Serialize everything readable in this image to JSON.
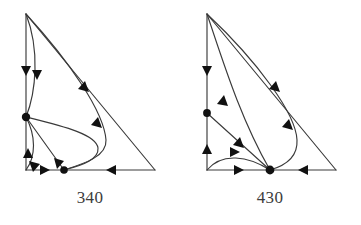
{
  "figure": {
    "type": "directed-graph-pair",
    "background_color": "#ffffff",
    "stroke_color": "#3a3a3a",
    "marker_color": "#111111",
    "caption_color": "#3c3c3c",
    "panels": [
      {
        "id": "panel-340",
        "caption": "340",
        "node_count": 4,
        "nodes": [
          {
            "name": "apex",
            "x": 26,
            "y": 14,
            "marker": "none"
          },
          {
            "name": "left-middle",
            "x": 26,
            "y": 117,
            "marker": "filled"
          },
          {
            "name": "bottom-left",
            "x": 26,
            "y": 170,
            "marker": "none"
          },
          {
            "name": "bottom-inner",
            "x": 64,
            "y": 170,
            "marker": "filled"
          },
          {
            "name": "bottom-right",
            "x": 155,
            "y": 170,
            "marker": "none"
          }
        ]
      },
      {
        "id": "panel-430",
        "caption": "430",
        "node_count": 4,
        "nodes": [
          {
            "name": "apex",
            "x": 27,
            "y": 14,
            "marker": "none"
          },
          {
            "name": "left-middle",
            "x": 27,
            "y": 113,
            "marker": "filled"
          },
          {
            "name": "bottom-left",
            "x": 27,
            "y": 170,
            "marker": "none"
          },
          {
            "name": "bottom-inner",
            "x": 90,
            "y": 170,
            "marker": "filled"
          },
          {
            "name": "bottom-right",
            "x": 156,
            "y": 170,
            "marker": "none"
          }
        ]
      }
    ]
  }
}
